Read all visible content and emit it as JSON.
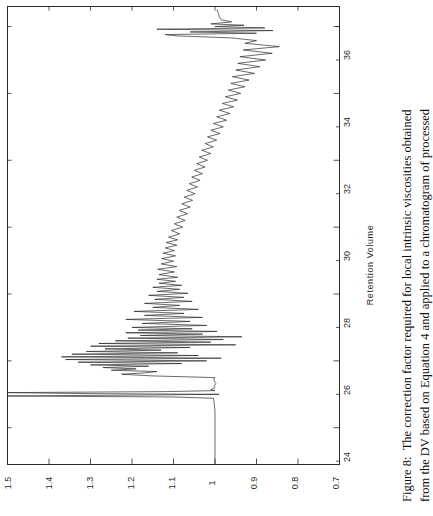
{
  "figure": {
    "caption_label": "Figure 8:",
    "caption_line_1": "The correction factor required for local intrinsic viscosities obtained",
    "caption_line_2": "from the DV based on Equation 4 and applied to a chromatogram of processed",
    "caption_full": "Figure 8: The correction factor required for local intrinsic viscosities obtained from the DV based on Equation 4 and applied to a chromatogram of processed",
    "orientation": "rotated-90-ccw",
    "line_color": "#2b2b2b",
    "frame_color": "#2b2b2b",
    "background_color": "#ffffff"
  },
  "axes": {
    "retention_volume": {
      "title": "Retention Volume",
      "ticks": [
        "24",
        "26",
        "28",
        "30",
        "32",
        "34",
        "36"
      ],
      "tick_values": [
        24,
        26,
        28,
        30,
        32,
        34,
        36
      ],
      "minor_tick_values": [
        23,
        25,
        27,
        29,
        31,
        33,
        35,
        36
      ],
      "range": [
        22.9,
        36.6
      ]
    },
    "correction_factor": {
      "title": "",
      "ticks": [
        "1.5",
        "1.4",
        "1.3",
        "1.2",
        "1.1",
        "1",
        "0.9",
        "0.8",
        "0.7"
      ],
      "tick_values": [
        1.5,
        1.4,
        1.3,
        1.2,
        1.1,
        1.0,
        0.9,
        0.8,
        0.7
      ],
      "range": [
        0.7,
        1.5
      ]
    }
  },
  "chart_data": {
    "type": "line",
    "title": "",
    "xlabel": "Retention Volume",
    "ylabel": "",
    "xlim": [
      22.9,
      36.6
    ],
    "ylim": [
      0.7,
      1.5
    ],
    "grid": false,
    "legend": "none",
    "xticks": [
      24,
      26,
      28,
      30,
      32,
      34,
      36
    ],
    "yticks": [
      0.7,
      0.8,
      0.9,
      1.0,
      1.1,
      1.2,
      1.3,
      1.4,
      1.5
    ],
    "series": [
      {
        "name": "correction factor",
        "x": [
          22.9,
          23.1,
          23.3,
          23.5,
          23.7,
          23.9,
          24.1,
          24.3,
          24.5,
          24.62,
          24.74,
          24.82,
          24.88,
          24.92,
          24.95,
          24.98,
          25.0,
          25.02,
          25.05,
          25.08,
          25.11,
          25.14,
          25.17,
          25.2,
          25.24,
          25.28,
          25.32,
          25.36,
          25.4,
          25.45,
          25.5,
          25.55,
          25.6,
          25.64,
          25.68,
          25.72,
          25.76,
          25.8,
          25.84,
          25.88,
          25.92,
          25.96,
          26.0,
          26.04,
          26.08,
          26.12,
          26.16,
          26.2,
          26.24,
          26.28,
          26.32,
          26.36,
          26.4,
          26.44,
          26.48,
          26.52,
          26.56,
          26.6,
          26.64,
          26.68,
          26.72,
          26.76,
          26.8,
          26.84,
          26.88,
          26.92,
          26.96,
          27.0,
          27.06,
          27.12,
          27.18,
          27.24,
          27.3,
          27.36,
          27.42,
          27.48,
          27.54,
          27.6,
          27.66,
          27.72,
          27.78,
          27.84,
          27.9,
          27.96,
          28.02,
          28.08,
          28.14,
          28.2,
          28.26,
          28.32,
          28.38,
          28.44,
          28.5,
          28.58,
          28.66,
          28.74,
          28.82,
          28.9,
          28.98,
          29.06,
          29.14,
          29.22,
          29.3,
          29.38,
          29.46,
          29.54,
          29.62,
          29.7,
          29.8,
          29.9,
          30.0,
          30.1,
          30.2,
          30.3,
          30.4,
          30.5,
          30.6,
          30.7,
          30.8,
          30.9,
          31.0,
          31.1,
          31.2,
          31.3,
          31.4,
          31.5,
          31.6,
          31.7,
          31.8,
          31.9,
          32.0,
          32.1,
          32.2,
          32.3,
          32.4,
          32.5,
          32.6,
          32.7,
          32.8,
          32.9,
          33.0,
          33.1,
          33.2,
          33.3,
          33.4,
          33.5,
          33.6,
          33.7,
          33.8,
          33.9,
          34.0,
          34.1,
          34.2,
          34.3,
          34.4,
          34.5,
          34.6,
          34.7,
          34.8,
          34.9,
          35.0,
          35.1,
          35.2,
          35.3,
          35.4,
          35.5,
          35.58,
          35.66,
          35.72,
          35.76,
          35.8,
          35.84,
          35.88,
          35.92,
          35.96,
          36.0,
          36.04,
          36.08,
          36.14,
          36.2,
          36.3,
          36.4,
          36.5
        ],
        "y": [
          1.0,
          1.0,
          1.0,
          1.0,
          1.0,
          1.0,
          1.0,
          1.0,
          1.0,
          1.001,
          1.002,
          1.003,
          1.004,
          1.1,
          1.5,
          1.15,
          0.99,
          1.3,
          1.5,
          1.12,
          1.0,
          1.01,
          1.005,
          1.0,
          1.002,
          1.0,
          0.998,
          1.0,
          1.001,
          1.003,
          1.0,
          1.15,
          1.225,
          1.17,
          1.14,
          1.25,
          1.19,
          1.27,
          1.16,
          1.3,
          1.08,
          1.33,
          1.02,
          1.36,
          0.985,
          1.37,
          1.04,
          1.345,
          1.09,
          1.31,
          1.13,
          1.265,
          1.06,
          1.3,
          0.95,
          1.28,
          1.01,
          1.24,
          0.98,
          1.21,
          0.935,
          1.18,
          1.03,
          1.215,
          0.995,
          1.185,
          1.055,
          1.2,
          1.02,
          1.175,
          1.06,
          1.215,
          1.03,
          1.17,
          1.075,
          1.195,
          1.04,
          1.15,
          1.085,
          1.17,
          1.055,
          1.145,
          1.075,
          1.16,
          1.065,
          1.14,
          1.085,
          1.15,
          1.08,
          1.135,
          1.095,
          1.14,
          1.09,
          1.135,
          1.098,
          1.138,
          1.092,
          1.13,
          1.1,
          1.128,
          1.095,
          1.125,
          1.098,
          1.12,
          1.092,
          1.118,
          1.09,
          1.112,
          1.085,
          1.105,
          1.078,
          1.098,
          1.072,
          1.092,
          1.066,
          1.086,
          1.06,
          1.08,
          1.054,
          1.074,
          1.048,
          1.068,
          1.042,
          1.062,
          1.036,
          1.056,
          1.03,
          1.05,
          1.024,
          1.044,
          1.018,
          1.038,
          1.01,
          1.032,
          1.004,
          1.024,
          0.996,
          1.018,
          0.988,
          1.01,
          0.98,
          1.004,
          0.972,
          0.996,
          0.964,
          0.99,
          0.955,
          0.982,
          0.946,
          0.975,
          0.938,
          0.968,
          0.928,
          0.962,
          0.918,
          0.958,
          0.905,
          0.95,
          0.892,
          0.945,
          0.878,
          0.94,
          0.862,
          0.932,
          0.845,
          0.928,
          0.9,
          0.96,
          1.09,
          1.12,
          0.9,
          1.06,
          0.86,
          1.14,
          0.88,
          1.0,
          0.93,
          1.01,
          0.96,
          0.985,
          0.99,
          0.992,
          0.995
        ]
      }
    ]
  }
}
